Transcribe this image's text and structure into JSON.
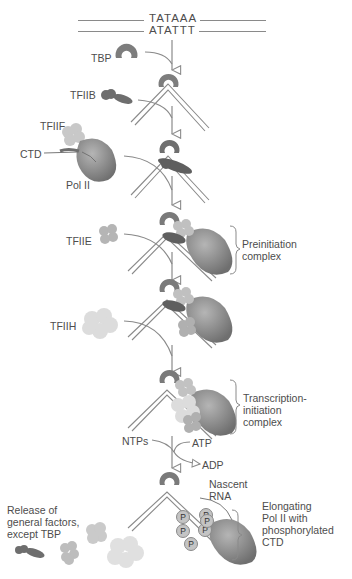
{
  "figure": {
    "dna": {
      "top_strand": "TATAAA",
      "bottom_strand": "ATATTT"
    },
    "factors": {
      "tbp": "TBP",
      "tfiib": "TFIIB",
      "tfiif": "TFIIF",
      "ctd": "CTD",
      "pol2": "Pol II",
      "tfiie": "TFIIE",
      "tfiih": "TFIIH"
    },
    "brackets": {
      "preinitiation": "Preinitiation\ncomplex",
      "transcription_initiation": "Transcription-\ninitiation\ncomplex",
      "elongating": "Elongating\nPol II with\nphosphorylated\nCTD"
    },
    "energy": {
      "ntps": "NTPs",
      "atp": "ATP",
      "adp": "ADP"
    },
    "nascent_rna": "Nascent\nRNA",
    "release_note": "Release of\ngeneral factors,\nexcept TBP",
    "phosphate_label": "P",
    "phosphate_count": 6,
    "colors": {
      "tbp": "#7d7d7d",
      "tfiib": "#6e6e6e",
      "tfiif": "#c8c8c8",
      "pol2": "#8f8f8f",
      "tfiie": "#b5b5b5",
      "tfiih": "#dcdcdc",
      "dna": "#8a8a8a",
      "text": "#4d4d4d"
    }
  }
}
